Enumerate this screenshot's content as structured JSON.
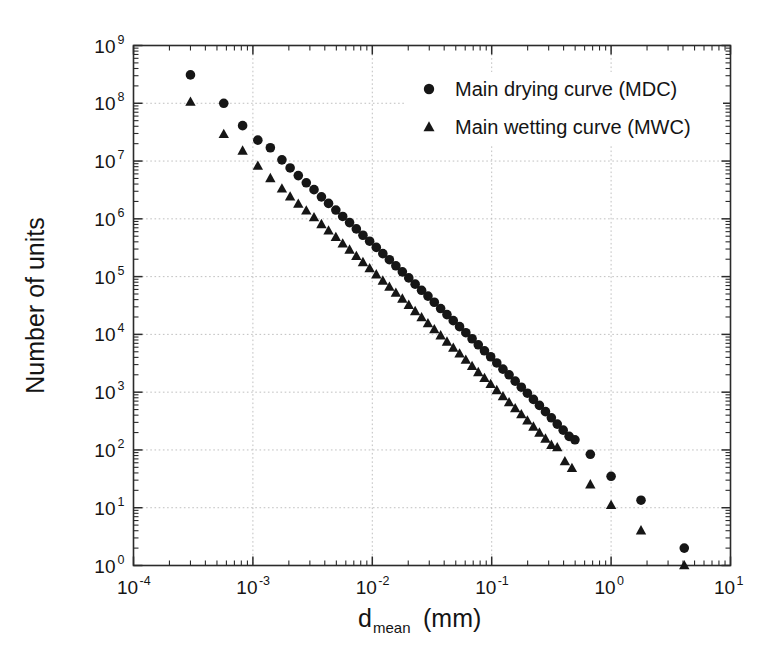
{
  "chart_data": {
    "type": "scatter",
    "title": "",
    "xlabel": "d_mean (mm)",
    "xlabel_base": "d",
    "xlabel_sub": "mean",
    "xlabel_unit": "(mm)",
    "ylabel": "Number of units",
    "xscale": "log",
    "yscale": "log",
    "xlim": [
      0.0001,
      10
    ],
    "ylim": [
      1,
      1000000000
    ],
    "grid": true,
    "grid_style": "dotted-major-decades",
    "legend_position": "top-right-inside",
    "xticks": [
      0.0001,
      0.001,
      0.01,
      0.1,
      1,
      10
    ],
    "xtick_labels": [
      "10-4",
      "10-3",
      "10-2",
      "10-1",
      "100",
      "101"
    ],
    "xtick_mantissa": [
      "10",
      "10",
      "10",
      "10",
      "10",
      "10"
    ],
    "xtick_exponents": [
      "-4",
      "-3",
      "-2",
      "-1",
      "0",
      "1"
    ],
    "yticks": [
      1,
      10,
      100,
      1000,
      10000,
      100000,
      1000000,
      10000000,
      100000000,
      1000000000
    ],
    "ytick_mantissa": [
      "10",
      "10",
      "10",
      "10",
      "10",
      "10",
      "10",
      "10",
      "10",
      "10"
    ],
    "ytick_exponents": [
      "0",
      "1",
      "2",
      "3",
      "4",
      "5",
      "6",
      "7",
      "8",
      "9"
    ],
    "series": [
      {
        "name": "Main drying curve (MDC)",
        "key": "mdc",
        "marker": "circle",
        "color": "#161616",
        "marker_size": 9.6,
        "points": [
          [
            0.0003,
            310000000.0
          ],
          [
            0.00057,
            100000000.0
          ],
          [
            0.00082,
            41000000.0
          ],
          [
            0.0011,
            23000000.0
          ],
          [
            0.0014,
            17000000.0
          ],
          [
            0.00175,
            10500000.0
          ],
          [
            0.00205,
            7600000.0
          ],
          [
            0.0024,
            5600000.0
          ],
          [
            0.0028,
            4200000.0
          ],
          [
            0.00325,
            3200000.0
          ],
          [
            0.00375,
            2400000.0
          ],
          [
            0.0043,
            1850000.0
          ],
          [
            0.00495,
            1420000.0
          ],
          [
            0.00565,
            1100000.0
          ],
          [
            0.00645,
            860000.0
          ],
          [
            0.00735,
            670000.0
          ],
          [
            0.00835,
            520000.0
          ],
          [
            0.0095,
            410000.0
          ],
          [
            0.0108,
            320000.0
          ],
          [
            0.01225,
            250000.0
          ],
          [
            0.0139,
            196000.0
          ],
          [
            0.01575,
            154000.0
          ],
          [
            0.01785,
            121000.0
          ],
          [
            0.0202,
            95000.0
          ],
          [
            0.02285,
            74000.0
          ],
          [
            0.02585,
            58000.0
          ],
          [
            0.02925,
            46000.0
          ],
          [
            0.03305,
            36000.0
          ],
          [
            0.03735,
            28000.0
          ],
          [
            0.0422,
            22000.0
          ],
          [
            0.04765,
            17300.0
          ],
          [
            0.0538,
            13600.0
          ],
          [
            0.0607,
            10700.0
          ],
          [
            0.0685,
            8400.0
          ],
          [
            0.0772,
            6600.0
          ],
          [
            0.087,
            5200.0
          ],
          [
            0.098,
            4100.0
          ],
          [
            0.1103,
            3200.0
          ],
          [
            0.1242,
            2500.0
          ],
          [
            0.1398,
            2000.0
          ],
          [
            0.1573,
            1550.0
          ],
          [
            0.177,
            1220.0
          ],
          [
            0.199,
            960.0
          ],
          [
            0.2235,
            750.0
          ],
          [
            0.251,
            590.0
          ],
          [
            0.282,
            460.0
          ],
          [
            0.316,
            360.0
          ],
          [
            0.354,
            280.0
          ],
          [
            0.397,
            220.0
          ],
          [
            0.445,
            172.0
          ],
          [
            0.498,
            150.0
          ],
          [
            0.67,
            84.0
          ],
          [
            1.0,
            35.0
          ],
          [
            1.78,
            13.5
          ],
          [
            4.1,
            2.0
          ]
        ]
      },
      {
        "name": "Main wetting curve (MWC)",
        "key": "mwc",
        "marker": "triangle",
        "color": "#161616",
        "marker_size": 10.4,
        "points": [
          [
            0.0003,
            105000000.0
          ],
          [
            0.00057,
            29000000.0
          ],
          [
            0.00082,
            15000000.0
          ],
          [
            0.0011,
            8200000.0
          ],
          [
            0.0014,
            5000000.0
          ],
          [
            0.00175,
            3300000.0
          ],
          [
            0.00205,
            2400000.0
          ],
          [
            0.0024,
            1800000.0
          ],
          [
            0.0028,
            1380000.0
          ],
          [
            0.00325,
            1050000.0
          ],
          [
            0.00375,
            800000.0
          ],
          [
            0.0043,
            620000.0
          ],
          [
            0.00495,
            480000.0
          ],
          [
            0.00565,
            370000.0
          ],
          [
            0.00645,
            290000.0
          ],
          [
            0.00735,
            225000.0
          ],
          [
            0.00835,
            176000.0
          ],
          [
            0.0095,
            138000.0
          ],
          [
            0.0108,
            108000.0
          ],
          [
            0.01225,
            84000.0
          ],
          [
            0.0139,
            66000.0
          ],
          [
            0.01575,
            52000.0
          ],
          [
            0.01785,
            41000.0
          ],
          [
            0.0202,
            32000.0
          ],
          [
            0.02285,
            25000.0
          ],
          [
            0.02585,
            19600.0
          ],
          [
            0.02925,
            15400.0
          ],
          [
            0.03305,
            12100.0
          ],
          [
            0.03735,
            9500.0
          ],
          [
            0.0422,
            7400.0
          ],
          [
            0.04765,
            5800.0
          ],
          [
            0.0538,
            4600.0
          ],
          [
            0.0607,
            3600.0
          ],
          [
            0.0685,
            2800.0
          ],
          [
            0.0772,
            2200.0
          ],
          [
            0.087,
            1740.0
          ],
          [
            0.098,
            1370.0
          ],
          [
            0.1103,
            1070.0
          ],
          [
            0.1242,
            840.0
          ],
          [
            0.1398,
            660.0
          ],
          [
            0.1573,
            520.0
          ],
          [
            0.177,
            410.0
          ],
          [
            0.199,
            320.0
          ],
          [
            0.2235,
            250.0
          ],
          [
            0.251,
            197.0
          ],
          [
            0.282,
            155.0
          ],
          [
            0.316,
            121.0
          ],
          [
            0.354,
            110.0
          ],
          [
            0.41,
            63.0
          ],
          [
            0.47,
            48.0
          ],
          [
            0.67,
            25.0
          ],
          [
            1.0,
            11.0
          ],
          [
            1.78,
            4.0
          ],
          [
            4.1,
            1.0
          ]
        ]
      }
    ]
  },
  "legend": {
    "entries": [
      {
        "label": "Main drying curve (MDC)",
        "marker": "circle"
      },
      {
        "label": "Main wetting curve (MWC)",
        "marker": "triangle"
      }
    ]
  }
}
